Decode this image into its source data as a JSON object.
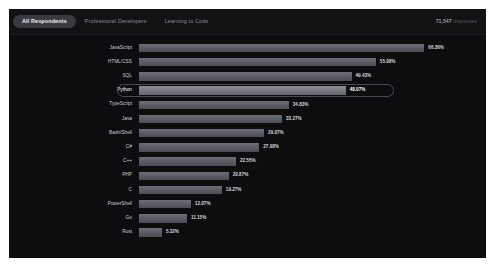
{
  "header": {
    "tabs": [
      {
        "label": "All Respondents",
        "active": true
      },
      {
        "label": "Professional Developers",
        "active": false
      },
      {
        "label": "Learning to Code",
        "active": false
      }
    ],
    "responses_count": "71,547",
    "responses_word": "responses"
  },
  "colors": {
    "panel_bg": "#0d0d0f",
    "tabbar_bg": "#121214",
    "bar": "#5a5a62",
    "bar_highlight": "#76767f",
    "active_tab_bg": "#3a3a40",
    "text": "#c9c9cf",
    "muted_text": "#5d5d64",
    "highlight_border": "#4a4a52"
  },
  "chart_data": {
    "type": "bar",
    "orientation": "horizontal",
    "title": "",
    "xlabel": "",
    "ylabel": "",
    "xlim": [
      0,
      70
    ],
    "grid": false,
    "legend": false,
    "value_suffix": "%",
    "highlighted_category": "Python",
    "categories": [
      "JavaScript",
      "HTML/CSS",
      "SQL",
      "Python",
      "TypeScript",
      "Java",
      "Bash/Shell",
      "C#",
      "C++",
      "PHP",
      "C",
      "PowerShell",
      "Go",
      "Rust"
    ],
    "values": [
      66.36,
      55.08,
      49.43,
      48.07,
      34.83,
      33.27,
      29.07,
      27.98,
      22.55,
      20.87,
      19.27,
      12.07,
      11.15,
      5.32
    ],
    "labels": [
      "66.36%",
      "55.08%",
      "49.43%",
      "48.07%",
      "34.83%",
      "33.27%",
      "29.07%",
      "27.98%",
      "22.55%",
      "20.87%",
      "19.27%",
      "12.07%",
      "11.15%",
      "5.32%"
    ]
  }
}
